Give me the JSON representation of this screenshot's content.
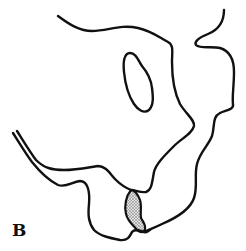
{
  "figure": {
    "panel_label": "B",
    "colors": {
      "line": "#111111",
      "background": "#ffffff",
      "stipple": "#9a9a9a"
    },
    "regions": [
      {
        "name": "upper-outline",
        "description": "upper curved contour"
      },
      {
        "name": "inner-oval",
        "description": "closed oval shape"
      },
      {
        "name": "right-outline",
        "description": "right wavy contour"
      },
      {
        "name": "lower-left-outline",
        "description": "double lower-left contour"
      },
      {
        "name": "stippled-region",
        "description": "shaded dotted area at junction"
      }
    ]
  }
}
